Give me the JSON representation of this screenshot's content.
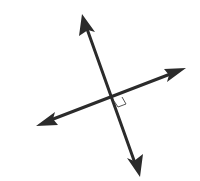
{
  "diagram": {
    "line_color": "#2b2b2b",
    "marker_color": "#555555",
    "lines": [
      {
        "name": "line-a",
        "arrows": "both"
      },
      {
        "name": "line-b",
        "arrows": "both"
      }
    ],
    "angle_marker": "right-angle",
    "angle_degrees": 90
  }
}
